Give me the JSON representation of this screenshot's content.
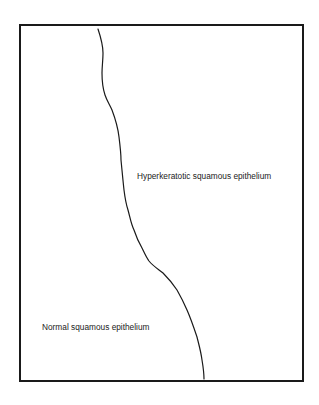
{
  "diagram": {
    "regions": [
      {
        "id": "hyperkeratotic",
        "label": "Hyperkeratotic squamous epithelium"
      },
      {
        "id": "normal",
        "label": "Normal squamous epithelium"
      }
    ],
    "colors": {
      "line": "#1a1a1a",
      "text": "#222222",
      "background": "#ffffff"
    }
  }
}
